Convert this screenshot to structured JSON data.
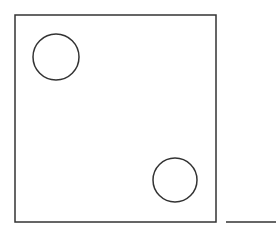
{
  "diagram": {
    "stroke_color": "#333333",
    "background": "#ffffff",
    "square": {
      "x": 15,
      "y": 15,
      "width": 201,
      "height": 207
    },
    "circles": [
      {
        "cx": 56,
        "cy": 57,
        "r": 23
      },
      {
        "cx": 175,
        "cy": 180,
        "r": 22
      }
    ],
    "line": {
      "x1": 226,
      "y1": 222,
      "x2": 276,
      "y2": 222
    }
  }
}
